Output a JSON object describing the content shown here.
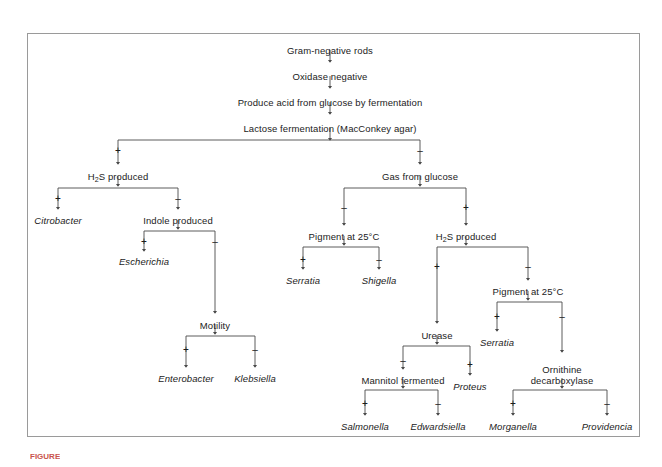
{
  "figure": {
    "caption_partial": "FIGURE",
    "caption_color": "#c9554e",
    "border_color": "#9a9a9a",
    "line_color": "#4a4a4a",
    "background": "#ffffff"
  },
  "signs": {
    "positive": "+",
    "negative": "–"
  },
  "nodes": [
    {
      "id": "gram_negative_rods",
      "label": "Gram-negative rods",
      "kind": "test",
      "x": 330,
      "y": 45
    },
    {
      "id": "oxidase_negative",
      "label": "Oxidase negative",
      "kind": "test",
      "x": 330,
      "y": 71
    },
    {
      "id": "produce_acid",
      "label": "Produce acid from glucose by fermentation",
      "kind": "test",
      "x": 330,
      "y": 97
    },
    {
      "id": "lactose_fermentation",
      "label": "Lactose fermentation (MacConkey agar)",
      "kind": "test",
      "x": 330,
      "y": 123
    },
    {
      "id": "h2s_produced_left",
      "label": "H₂S produced",
      "kind": "test",
      "x": 118,
      "y": 171
    },
    {
      "id": "gas_from_glucose",
      "label": "Gas from glucose",
      "kind": "test",
      "x": 420,
      "y": 171
    },
    {
      "id": "citrobacter",
      "label": "Citrobacter",
      "kind": "genus",
      "x": 58,
      "y": 215
    },
    {
      "id": "indole_produced",
      "label": "Indole produced",
      "kind": "test",
      "x": 178,
      "y": 215
    },
    {
      "id": "pigment_25_left",
      "label": "Pigment at 25°C",
      "kind": "test",
      "x": 344,
      "y": 231
    },
    {
      "id": "h2s_produced_right",
      "label": "H₂S produced",
      "kind": "test",
      "x": 466,
      "y": 231
    },
    {
      "id": "escherichia",
      "label": "Escherichia",
      "kind": "genus",
      "x": 144,
      "y": 256
    },
    {
      "id": "serratia_left",
      "label": "Serratia",
      "kind": "genus",
      "x": 303,
      "y": 275
    },
    {
      "id": "shigella",
      "label": "Shigella",
      "kind": "genus",
      "x": 379,
      "y": 275
    },
    {
      "id": "pigment_25_right",
      "label": "Pigment at 25°C",
      "kind": "test",
      "x": 528,
      "y": 286
    },
    {
      "id": "motility",
      "label": "Motility",
      "kind": "test",
      "x": 215,
      "y": 320
    },
    {
      "id": "urease",
      "label": "Urease",
      "kind": "test",
      "x": 437,
      "y": 330
    },
    {
      "id": "serratia_right",
      "label": "Serratia",
      "kind": "genus",
      "x": 497,
      "y": 337
    },
    {
      "id": "ornithine_decarb",
      "label": "Ornithine decarboxylase",
      "kind": "test",
      "x": 562,
      "y": 364,
      "multiline": true
    },
    {
      "id": "enterobacter",
      "label": "Enterobacter",
      "kind": "genus",
      "x": 186,
      "y": 373
    },
    {
      "id": "klebsiella",
      "label": "Klebsiella",
      "kind": "genus",
      "x": 255,
      "y": 373
    },
    {
      "id": "mannitol_fermented",
      "label": "Mannitol fermented",
      "kind": "test",
      "x": 403,
      "y": 375
    },
    {
      "id": "proteus",
      "label": "Proteus",
      "kind": "genus",
      "x": 470,
      "y": 381
    },
    {
      "id": "salmonella",
      "label": "Salmonella",
      "kind": "genus",
      "x": 365,
      "y": 421
    },
    {
      "id": "edwardsiella",
      "label": "Edwardsiella",
      "kind": "genus",
      "x": 438,
      "y": 421
    },
    {
      "id": "morganella",
      "label": "Morganella",
      "kind": "genus",
      "x": 513,
      "y": 421
    },
    {
      "id": "providencia",
      "label": "Providencia",
      "kind": "genus",
      "x": 607,
      "y": 421
    }
  ],
  "branch_signs": [
    {
      "id": "sign-lactose-pos",
      "sign": "+",
      "x": 118,
      "y": 146
    },
    {
      "id": "sign-lactose-neg",
      "sign": "–",
      "x": 420,
      "y": 146
    },
    {
      "id": "sign-h2s-left-pos",
      "sign": "+",
      "x": 58,
      "y": 194
    },
    {
      "id": "sign-h2s-left-neg",
      "sign": "–",
      "x": 178,
      "y": 194
    },
    {
      "id": "sign-gas-neg",
      "sign": "–",
      "x": 344,
      "y": 203
    },
    {
      "id": "sign-gas-pos",
      "sign": "+",
      "x": 466,
      "y": 203
    },
    {
      "id": "sign-indole-pos",
      "sign": "+",
      "x": 144,
      "y": 237
    },
    {
      "id": "sign-indole-neg",
      "sign": "–",
      "x": 215,
      "y": 237
    },
    {
      "id": "sign-pig-left-pos",
      "sign": "+",
      "x": 303,
      "y": 255
    },
    {
      "id": "sign-pig-left-neg",
      "sign": "–",
      "x": 379,
      "y": 255
    },
    {
      "id": "sign-h2s-right-pos",
      "sign": "+",
      "x": 437,
      "y": 262
    },
    {
      "id": "sign-h2s-right-neg",
      "sign": "–",
      "x": 528,
      "y": 262
    },
    {
      "id": "sign-pig-right-pos",
      "sign": "+",
      "x": 497,
      "y": 312
    },
    {
      "id": "sign-pig-right-neg",
      "sign": "–",
      "x": 562,
      "y": 312
    },
    {
      "id": "sign-motility-pos",
      "sign": "+",
      "x": 186,
      "y": 345
    },
    {
      "id": "sign-motility-neg",
      "sign": "–",
      "x": 255,
      "y": 345
    },
    {
      "id": "sign-urease-neg",
      "sign": "–",
      "x": 403,
      "y": 356
    },
    {
      "id": "sign-urease-pos",
      "sign": "+",
      "x": 470,
      "y": 360
    },
    {
      "id": "sign-mannitol-pos",
      "sign": "+",
      "x": 365,
      "y": 399
    },
    {
      "id": "sign-mannitol-neg",
      "sign": "–",
      "x": 438,
      "y": 399
    },
    {
      "id": "sign-ornithine-pos",
      "sign": "+",
      "x": 513,
      "y": 399
    },
    {
      "id": "sign-ornithine-neg",
      "sign": "–",
      "x": 607,
      "y": 399
    }
  ]
}
